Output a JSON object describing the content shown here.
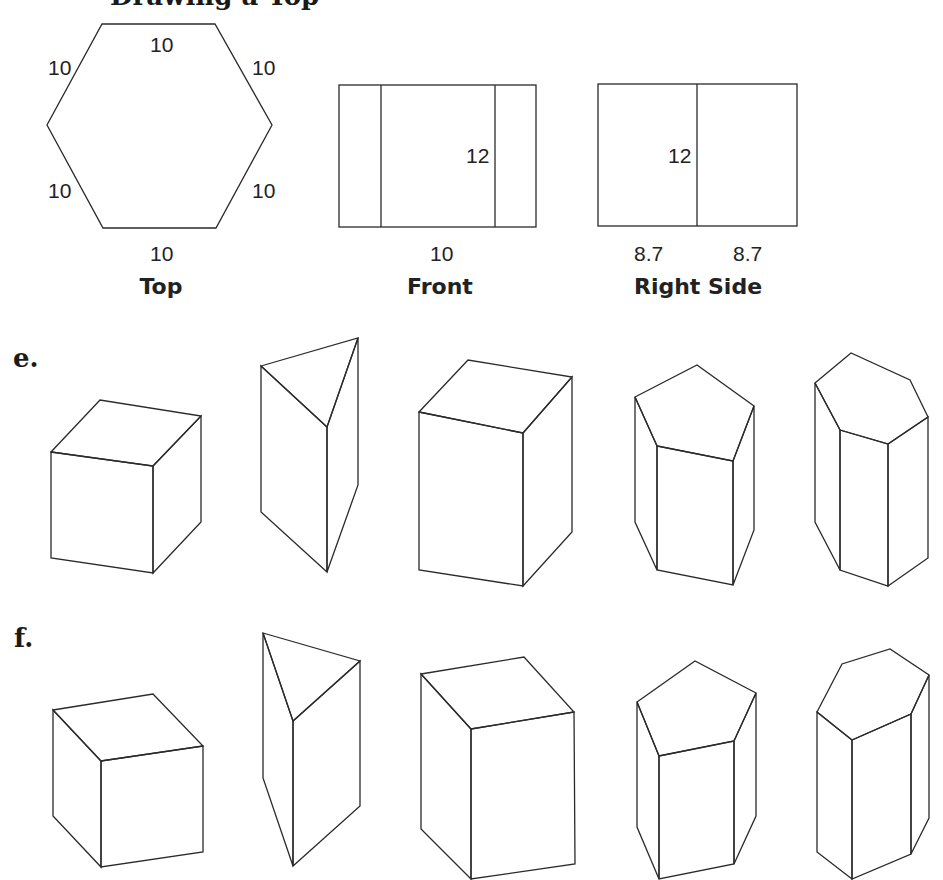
{
  "header": {
    "title_fragment": "...g...p..."
  },
  "views": {
    "top": {
      "label": "Top",
      "shape": "regular-hexagon",
      "edge_labels": [
        "10",
        "10",
        "10",
        "10",
        "10",
        "10"
      ]
    },
    "front": {
      "label": "Front",
      "height_label": "12",
      "width_label": "10"
    },
    "right_side": {
      "label": "Right Side",
      "height_label": "12",
      "width_labels": [
        "8.7",
        "8.7"
      ]
    }
  },
  "options": [
    {
      "label": "e.",
      "solids": [
        "cube",
        "triangular-prism",
        "rectangular-prism",
        "pentagonal-prism",
        "hexagonal-prism"
      ]
    },
    {
      "label": "f.",
      "solids": [
        "cube",
        "triangular-prism",
        "rectangular-prism",
        "pentagonal-prism",
        "hexagonal-prism"
      ]
    }
  ]
}
